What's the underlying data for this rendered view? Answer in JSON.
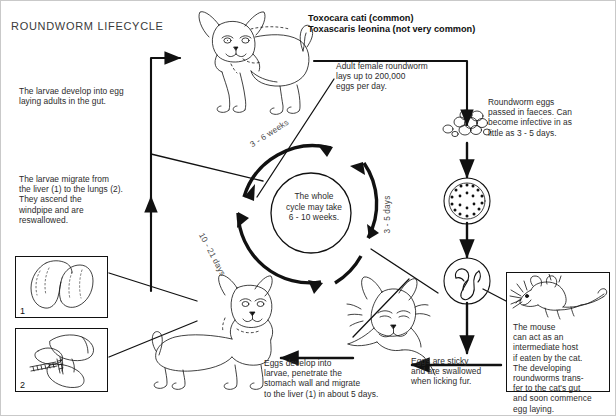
{
  "diagram": {
    "title": "ROUNDWORM LIFECYCLE",
    "species": "Toxocara cati (common)\nToxascaris leonina (not very common)",
    "centre_note": "The whole\ncycle may take\n6 - 10 weeks.",
    "arc_labels": {
      "top": "3 - 6 weeks",
      "right": "3 - 5 days",
      "left": "10 - 21 days"
    },
    "notes": {
      "larvae_adults": "The larvae develop into egg\nlaying adults in the gut.",
      "larvae_migrate": "The larvae migrate from\nthe liver (1) to the lungs (2).\nThey ascend the\nwindpipe and are\nreswallowed.",
      "adult_female": "Adult female roundworm\nlays up to 200,000\neggs per day.",
      "eggs_faeces": "Roundworm eggs\npassed in faeces. Can\nbecome infective in as\nlittle as 3 - 5 days.",
      "eggs_develop": "Eggs develop into\nlarvae, penetrate the\nstomach wall and migrate\nto the liver (1) in about 5 days.",
      "eggs_sticky": "Eggs are sticky\nand are swallowed\nwhen licking fur.",
      "mouse": "The mouse\ncan act as an\nintermediate host\nif eaten by the cat.\nThe developing\nroundworms trans-\nfer to the cat's gut\nand soon commence\negg laying."
    },
    "organ_boxes": [
      {
        "number": "1",
        "name": "liver"
      },
      {
        "number": "2",
        "name": "lungs"
      }
    ],
    "illustrations": [
      "adult-cat",
      "young-cat",
      "cat-licking-fur",
      "mouse",
      "egg-cluster",
      "egg-granular",
      "egg-with-larva",
      "liver",
      "lungs"
    ],
    "colors": {
      "ink": "#111111",
      "text": "#2b2b2b",
      "background": "#ffffff"
    }
  }
}
